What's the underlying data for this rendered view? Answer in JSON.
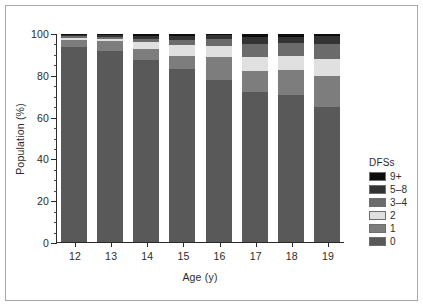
{
  "chart_data": {
    "type": "bar",
    "subtype": "stacked-percentage",
    "title": "",
    "xlabel": "Age (y)",
    "ylabel": "Population (%)",
    "categories": [
      "12",
      "13",
      "14",
      "15",
      "16",
      "17",
      "18",
      "19"
    ],
    "ylim": [
      0,
      100
    ],
    "yticks": [
      0,
      20,
      40,
      60,
      80,
      100
    ],
    "ytick_labels": [
      "0",
      "20",
      "40",
      "60",
      "80",
      "100"
    ],
    "yminor_tick_step": 5,
    "grid": false,
    "legend_position": "right",
    "legend_title": "DFSs",
    "series": [
      {
        "name": "0",
        "color": "#595959",
        "values": [
          93.5,
          92.0,
          87.5,
          83.0,
          78.0,
          72.0,
          70.5,
          65.0
        ]
      },
      {
        "name": "1",
        "color": "#7d7d7d",
        "values": [
          3.5,
          4.5,
          5.5,
          6.5,
          11.0,
          10.0,
          12.0,
          15.0
        ]
      },
      {
        "name": "2",
        "color": "#e0e0e0",
        "values": [
          1.0,
          1.0,
          3.0,
          5.0,
          5.0,
          7.0,
          7.0,
          8.0
        ]
      },
      {
        "name": "3-4",
        "color": "#6b6b6b",
        "values": [
          1.0,
          1.0,
          1.5,
          2.5,
          3.5,
          6.0,
          6.0,
          7.0
        ]
      },
      {
        "name": "5-8",
        "color": "#333333",
        "values": [
          0.5,
          0.8,
          1.5,
          2.0,
          2.0,
          3.5,
          3.0,
          4.0
        ]
      },
      {
        "name": "9+",
        "color": "#0d0d0d",
        "values": [
          0.5,
          0.7,
          1.0,
          1.0,
          0.5,
          1.5,
          1.5,
          1.0
        ]
      }
    ],
    "legend_entries": [
      {
        "label": "9+",
        "color": "#0d0d0d"
      },
      {
        "label": "5-8",
        "color": "#333333"
      },
      {
        "label": "3-4",
        "color": "#6b6b6b"
      },
      {
        "label": "2",
        "color": "#e0e0e0"
      },
      {
        "label": "1",
        "color": "#7d7d7d"
      },
      {
        "label": "0",
        "color": "#595959"
      }
    ]
  },
  "figure": {
    "border_color": "#a8a8a8",
    "background": "#ffffff",
    "axis_color": "#2b2b2b"
  }
}
